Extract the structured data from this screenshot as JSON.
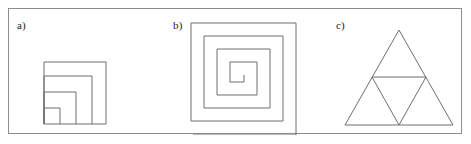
{
  "panel": {
    "width": 471,
    "height": 144,
    "background_color": "#ffffff",
    "border_color": "#8d8d8d",
    "stroke_color": "#6f6f6f",
    "label_color": "#222222"
  },
  "figures": [
    {
      "id": "a",
      "label": "a)",
      "name": "nested-squares",
      "description": "Four nested squares sharing a common bottom-left corner, drawn as concentric right-angle outlines.",
      "shape_type": "nested-squares",
      "square_count": 4,
      "square_sizes": [
        62,
        48,
        32,
        16
      ],
      "origin": {
        "x": 35,
        "y": 115
      },
      "paths": [
        "M 35 115 L 35 53 L 97 53 L 97 115 Z",
        "M 35 115 L 35 67 L 83 67 L 83 115",
        "M 35 115 L 35 83 L 67 83 L 67 115",
        "M 35 115 L 35 99 L 51 99 L 51 115"
      ]
    },
    {
      "id": "b",
      "label": "b)",
      "name": "rectangular-spiral",
      "description": "A square spiral of three and a half turns winding inward, with a tail running off to the lower left.",
      "shape_type": "spiral",
      "turns": 3.5,
      "spacing": 13,
      "path": "M 10 126 L 113 126 L 113 14 L 8 14 L 8 112 L 100 112 L 100 27 L 21 27 L 21 99 L 87 99 L 87 40 L 34 40 L 34 86 L 74 86 L 74 53 L 47 53 L 47 73 L 61 73 L 61 66"
    },
    {
      "id": "c",
      "label": "c)",
      "name": "sierpinski-triangle",
      "description": "A Sierpinski triangle at iteration one: a large equilateral triangle containing a central inverted triangle, leaving three upright sub-triangles.",
      "shape_type": "sierpinski-triangle",
      "iteration": 1,
      "sub_triangle_count": 3,
      "outer_triangle": "M 12 116 L 66 21 L 120 116 Z",
      "inner_triangle": "M 39 68 L 93 68 L 66 116 Z"
    }
  ]
}
